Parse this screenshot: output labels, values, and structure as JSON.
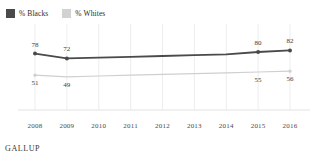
{
  "chart_data": {
    "type": "line",
    "title": "",
    "subtitle": "",
    "xlabel": "",
    "ylabel": "",
    "grid": true,
    "legend_position": "top-left",
    "source": "GALLUP",
    "categories": [
      "2008",
      "2009",
      "2010",
      "2011",
      "2012",
      "2013",
      "2014",
      "2015",
      "2016"
    ],
    "xlim": [
      "2008",
      "2016"
    ],
    "ylim": [
      0,
      100
    ],
    "series": [
      {
        "name": "% Blacks",
        "color": "#4a4a4a",
        "values": [
          78,
          72,
          73,
          74,
          75,
          76,
          77,
          80,
          82
        ],
        "labeled_points": [
          {
            "category": "2008",
            "value": 78,
            "label": "78",
            "position": "above"
          },
          {
            "category": "2009",
            "value": 72,
            "label": "72",
            "position": "above"
          },
          {
            "category": "2015",
            "value": 80,
            "label": "80",
            "position": "above"
          },
          {
            "category": "2016",
            "value": 82,
            "label": "82",
            "position": "above"
          }
        ],
        "markers": [
          "2008",
          "2009",
          "2015",
          "2016"
        ]
      },
      {
        "name": "% Whites",
        "color": "#cfcfcf",
        "values": [
          51,
          49,
          50,
          51,
          52,
          53,
          54,
          55,
          56
        ],
        "labeled_points": [
          {
            "category": "2008",
            "value": 51,
            "label": "51",
            "position": "below"
          },
          {
            "category": "2009",
            "value": 49,
            "label": "49",
            "position": "below"
          },
          {
            "category": "2015",
            "value": 55,
            "label": "55",
            "position": "below"
          },
          {
            "category": "2016",
            "value": 56,
            "label": "56",
            "position": "below"
          }
        ],
        "markers": [
          "2008",
          "2016"
        ]
      }
    ]
  },
  "legend": {
    "entries": [
      {
        "label": "% Blacks",
        "color": "#4a4a4a"
      },
      {
        "label": "% Whites",
        "color": "#d2d2d2"
      }
    ]
  },
  "axis": {
    "ticks": [
      "2008",
      "2009",
      "2010",
      "2011",
      "2012",
      "2013",
      "2014",
      "2015",
      "2016"
    ]
  },
  "footer": {
    "source": "GALLUP"
  }
}
